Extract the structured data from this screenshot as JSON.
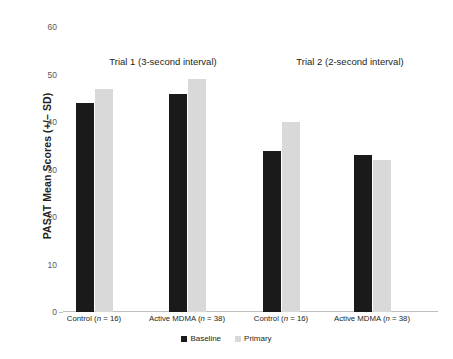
{
  "chart_data": {
    "type": "bar",
    "title": "",
    "xlabel": "",
    "ylabel": "PASAT Mean Scores (+/– SD)",
    "ylim": [
      0,
      60
    ],
    "yticks": [
      0,
      10,
      20,
      30,
      40,
      50,
      60
    ],
    "ytick_labels": [
      "0",
      "10",
      "20",
      "30",
      "40",
      "50",
      "60"
    ],
    "grid": false,
    "legend_position": "bottom-center",
    "categories": [
      "Control (n = 16)",
      "Active MDMA (n = 38)",
      "Control (n = 16)",
      "Active MDMA (n = 38)"
    ],
    "series": [
      {
        "name": "Baseline",
        "color": "#1a1a1a",
        "values": [
          44,
          46,
          34,
          33
        ]
      },
      {
        "name": "Primary",
        "color": "#d9d9d9",
        "values": [
          47,
          49,
          40,
          32
        ]
      }
    ],
    "group_annotations": [
      {
        "label": "Trial 1 (3-second interval)",
        "categories": [
          0,
          1
        ]
      },
      {
        "label": "Trial 2 (2-second interval)",
        "categories": [
          2,
          3
        ]
      }
    ]
  },
  "axis": {
    "y_title": "PASAT Mean Scores (+/– SD)",
    "ticks": [
      "60",
      "50",
      "40",
      "30",
      "20",
      "10",
      "0"
    ]
  },
  "groups": [
    {
      "title": "Trial 1 (3-second interval)"
    },
    {
      "title": "Trial 2 (2-second interval)"
    }
  ],
  "categories": [
    {
      "name": "Control",
      "n_prefix": "(",
      "n_var": "n",
      "n_text": " = 16)"
    },
    {
      "name": "Active MDMA",
      "n_prefix": "(",
      "n_var": "n",
      "n_text": " = 38)"
    },
    {
      "name": "Control",
      "n_prefix": "(",
      "n_var": "n",
      "n_text": " = 16)"
    },
    {
      "name": "Active MDMA",
      "n_prefix": "(",
      "n_var": "n",
      "n_text": " = 38)"
    }
  ],
  "legend": [
    {
      "label": "Baseline",
      "color": "#1a1a1a"
    },
    {
      "label": "Primary",
      "color": "#d9d9d9"
    }
  ],
  "colors": {
    "baseline": "#1a1a1a",
    "primary": "#d9d9d9",
    "axis": "#bfbfbf",
    "text": "#231f20",
    "tick_text": "#58595b",
    "background": "#ffffff"
  }
}
